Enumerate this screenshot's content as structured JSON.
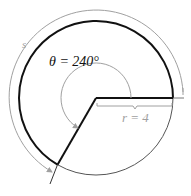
{
  "diagram": {
    "angle_label": "θ = 240°",
    "radius_label": "r = 4",
    "arc_length_label": "s",
    "angle_degrees": 240,
    "radius_value": 4,
    "colors": {
      "sector_arc": "#111111",
      "remaining_arc": "#555555",
      "annotation": "#a0a0a0",
      "rays": "#111111"
    }
  }
}
